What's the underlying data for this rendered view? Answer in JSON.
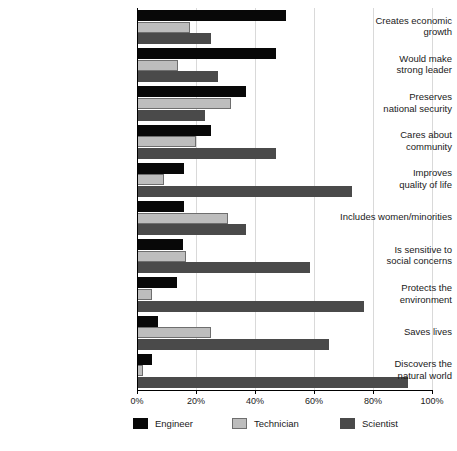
{
  "chart_data": {
    "type": "bar",
    "orientation": "horizontal",
    "title": "",
    "subtitle": "",
    "xlabel": "",
    "ylabel": "",
    "xlim": [
      0,
      100
    ],
    "xticks": [
      0,
      20,
      40,
      60,
      80,
      100
    ],
    "xtick_labels": [
      "0%",
      "20%",
      "40%",
      "60%",
      "80%",
      "100%"
    ],
    "grid": true,
    "grid_axis": "x",
    "legend_position": "bottom",
    "categories": [
      "Creates economic growth",
      "Would make strong leader",
      "Preserves national security",
      "Cares about community",
      "Improves quality of life",
      "Includes women/minorities",
      "Is sensitive to social concerns",
      "Protects the environment",
      "Saves lives",
      "Discovers the natural world"
    ],
    "category_lines": [
      [
        "Creates economic",
        "growth"
      ],
      [
        "Would make",
        "strong leader"
      ],
      [
        "Preserves",
        "national security"
      ],
      [
        "Cares about",
        "community"
      ],
      [
        "Improves",
        "quality of life"
      ],
      [
        "Includes women/minorities"
      ],
      [
        "Is sensitive to",
        "social concerns"
      ],
      [
        "Protects the",
        "environment"
      ],
      [
        "Saves lives"
      ],
      [
        "Discovers the",
        "natural world"
      ]
    ],
    "series": [
      {
        "name": "Engineer",
        "color": "#080808",
        "values": [
          50.5,
          47.0,
          37.0,
          25.0,
          16.0,
          16.0,
          15.5,
          13.5,
          7.0,
          5.0
        ]
      },
      {
        "name": "Technician",
        "color": "#bdbdbd",
        "values": [
          18.0,
          14.0,
          32.0,
          20.0,
          9.0,
          31.0,
          16.5,
          5.0,
          25.0,
          2.0
        ]
      },
      {
        "name": "Scientist",
        "color": "#4a4a4a",
        "values": [
          25.0,
          27.5,
          23.0,
          47.0,
          73.0,
          37.0,
          58.5,
          77.0,
          65.0,
          92.0
        ]
      }
    ]
  },
  "legend": {
    "items": [
      {
        "label": "Engineer",
        "swatch": "engineer-swatch"
      },
      {
        "label": "Technician",
        "swatch": "technician-swatch"
      },
      {
        "label": "Scientist",
        "swatch": "scientist-swatch"
      }
    ]
  }
}
